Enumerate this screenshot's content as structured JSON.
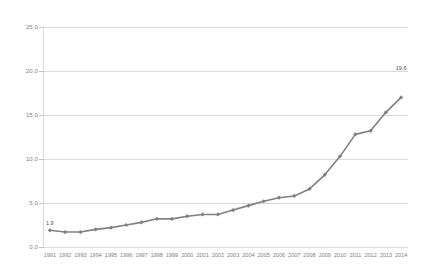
{
  "chart_data": {
    "type": "line",
    "title": "",
    "subtitle": "",
    "xlabel": "",
    "ylabel": "",
    "categories": [
      "1991",
      "1992",
      "1993",
      "1994",
      "1995",
      "1996",
      "1997",
      "1998",
      "1999",
      "2000",
      "2001",
      "2002",
      "2003",
      "2004",
      "2005",
      "2006",
      "2007",
      "2008",
      "2009",
      "2010",
      "2011",
      "2012",
      "2013",
      "2014"
    ],
    "values": [
      1.9,
      1.7,
      1.7,
      2.0,
      2.2,
      2.5,
      2.8,
      3.2,
      3.2,
      3.5,
      3.7,
      3.7,
      4.2,
      4.7,
      5.2,
      5.6,
      5.8,
      6.6,
      8.2,
      10.3,
      12.8,
      13.2,
      15.3,
      17.0
    ],
    "series": [
      {
        "name": "series-1",
        "values": [
          1.9,
          1.7,
          1.7,
          2.0,
          2.2,
          2.5,
          2.8,
          3.2,
          3.2,
          3.5,
          3.7,
          3.7,
          4.2,
          4.7,
          5.2,
          5.6,
          5.8,
          6.6,
          8.2,
          10.3,
          12.8,
          13.2,
          15.3,
          17.0
        ],
        "color": "#808080"
      }
    ],
    "ylim": [
      0.0,
      25.0
    ],
    "y_ticks": [
      0.0,
      5.0,
      10.0,
      15.0,
      20.0,
      25.0
    ],
    "y_tick_labels": [
      "0.0",
      "5.0",
      "10.0",
      "15.0",
      "20.0",
      "25.0"
    ],
    "grid": true,
    "legend": false,
    "legend_position": "none",
    "marker": "diamond",
    "line_color": "#808080",
    "grid_color": "#d9d9d9",
    "point_labels": [
      {
        "category": "1991",
        "value": 1.9,
        "text": "1.9"
      },
      {
        "category": "2014",
        "value": 19.6,
        "text": "19.6"
      }
    ]
  },
  "axes": {
    "y_axis_name": "value-axis",
    "x_axis_name": "category-axis"
  }
}
